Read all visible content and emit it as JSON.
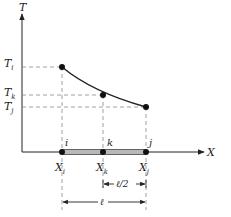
{
  "axes": {
    "y_label": "T",
    "x_label": "X"
  },
  "temperature_labels": {
    "ti": {
      "main": "T",
      "sub": "i"
    },
    "tk": {
      "main": "T",
      "sub": "k"
    },
    "tj": {
      "main": "T",
      "sub": "j"
    }
  },
  "nodes": [
    {
      "id": "i",
      "label": "i",
      "x_main": "X",
      "x_sub": "i"
    },
    {
      "id": "k",
      "label": "k",
      "x_main": "X",
      "x_sub": "k"
    },
    {
      "id": "j",
      "label": "j",
      "x_main": "X",
      "x_sub": "j"
    }
  ],
  "dimensions": {
    "half_length": "ℓ/2",
    "length": "ℓ"
  },
  "colors": {
    "line": "#222222",
    "dash": "#888888",
    "bar_fill": "#b8b8b8"
  }
}
